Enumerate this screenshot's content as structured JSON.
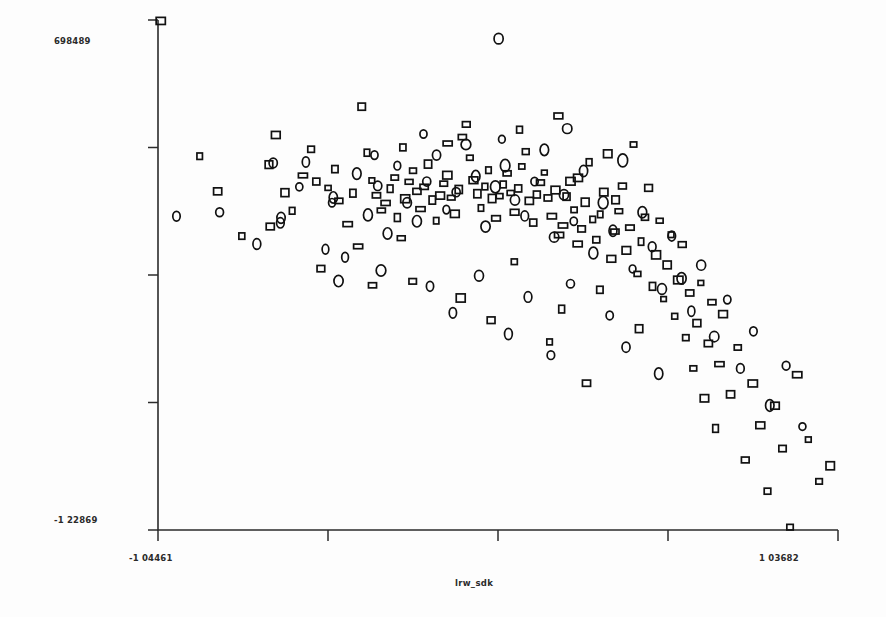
{
  "chart_data": {
    "type": "scatter",
    "title": "",
    "subtitle": "",
    "xlabel": "lrw_sdk",
    "ylabel": "",
    "xlim": [
      -1.04461,
      1.03682
    ],
    "ylim": [
      -1.22869,
      0.698489
    ],
    "x_tick_labels": [
      "-1 04461",
      "1 03682"
    ],
    "y_tick_labels": [
      "698489",
      "-1 22869"
    ],
    "x_tick_count": 5,
    "y_tick_count": 5,
    "grid": false,
    "legend": null,
    "legend_position": "none",
    "axis_style": "left-and-bottom-spines-only",
    "marker_colors": {
      "square": "#111111",
      "circle": "#111111"
    },
    "background": "#ffffff",
    "series": [
      {
        "name": "square",
        "marker": "open-square",
        "points": [
          [
            -1.0362,
            0.695
          ],
          [
            -0.917,
            0.1838
          ],
          [
            -0.705,
            0.152
          ],
          [
            -0.656,
            0.046
          ],
          [
            -0.634,
            -0.0225
          ],
          [
            -0.601,
            0.111
          ],
          [
            -0.701,
            -0.082
          ],
          [
            -0.576,
            0.21
          ],
          [
            -0.56,
            0.088
          ],
          [
            -0.524,
            0.064
          ],
          [
            -0.503,
            0.135
          ],
          [
            -0.491,
            0.015
          ],
          [
            -0.464,
            -0.073
          ],
          [
            -0.448,
            0.044
          ],
          [
            -0.432,
            -0.157
          ],
          [
            -0.421,
            0.371
          ],
          [
            -0.405,
            0.197
          ],
          [
            -0.39,
            0.092
          ],
          [
            -0.376,
            0.036
          ],
          [
            -0.361,
            -0.021
          ],
          [
            -0.348,
            0.007
          ],
          [
            -0.334,
            0.061
          ],
          [
            -0.32,
            0.103
          ],
          [
            -0.312,
            -0.048
          ],
          [
            -0.3,
            -0.126
          ],
          [
            -0.288,
            0.023
          ],
          [
            -0.276,
            0.087
          ],
          [
            -0.264,
            0.129
          ],
          [
            -0.252,
            0.051
          ],
          [
            -0.241,
            -0.016
          ],
          [
            -0.23,
            0.068
          ],
          [
            -0.218,
            0.154
          ],
          [
            -0.205,
            0.018
          ],
          [
            -0.193,
            -0.06
          ],
          [
            -0.181,
            0.035
          ],
          [
            -0.17,
            0.08
          ],
          [
            -0.159,
            0.112
          ],
          [
            -0.147,
            0.027
          ],
          [
            -0.136,
            -0.034
          ],
          [
            -0.124,
            0.058
          ],
          [
            -0.113,
            0.256
          ],
          [
            -0.101,
            0.304
          ],
          [
            -0.09,
            0.178
          ],
          [
            -0.079,
            0.093
          ],
          [
            -0.067,
            0.042
          ],
          [
            -0.056,
            -0.012
          ],
          [
            -0.044,
            0.069
          ],
          [
            -0.033,
            0.131
          ],
          [
            -0.022,
            0.024
          ],
          [
            -0.01,
            -0.051
          ],
          [
            0.001,
            0.033
          ],
          [
            0.012,
            0.077
          ],
          [
            0.024,
            0.119
          ],
          [
            0.035,
            0.045
          ],
          [
            0.047,
            -0.028
          ],
          [
            0.058,
            0.062
          ],
          [
            0.069,
            0.145
          ],
          [
            0.081,
            0.201
          ],
          [
            0.092,
            0.015
          ],
          [
            0.104,
            -0.067
          ],
          [
            0.115,
            0.039
          ],
          [
            0.126,
            0.084
          ],
          [
            0.138,
            0.122
          ],
          [
            0.149,
            0.026
          ],
          [
            0.161,
            -0.043
          ],
          [
            0.172,
            0.056
          ],
          [
            0.183,
            -0.114
          ],
          [
            0.195,
            -0.078
          ],
          [
            0.206,
            0.031
          ],
          [
            0.218,
            0.089
          ],
          [
            0.229,
            -0.019
          ],
          [
            0.24,
            -0.148
          ],
          [
            0.252,
            -0.091
          ],
          [
            0.263,
            0.01
          ],
          [
            0.275,
            0.161
          ],
          [
            0.286,
            -0.055
          ],
          [
            0.297,
            -0.132
          ],
          [
            0.309,
            -0.036
          ],
          [
            0.32,
            0.048
          ],
          [
            0.332,
            0.193
          ],
          [
            0.343,
            -0.204
          ],
          [
            0.354,
            -0.101
          ],
          [
            0.366,
            -0.024
          ],
          [
            0.377,
            0.071
          ],
          [
            0.389,
            -0.172
          ],
          [
            0.4,
            -0.086
          ],
          [
            0.411,
            0.228
          ],
          [
            0.423,
            -0.261
          ],
          [
            0.434,
            -0.139
          ],
          [
            0.446,
            -0.047
          ],
          [
            0.457,
            0.064
          ],
          [
            0.469,
            -0.308
          ],
          [
            0.48,
            -0.189
          ],
          [
            0.491,
            -0.06
          ],
          [
            0.503,
            -0.356
          ],
          [
            0.514,
            -0.227
          ],
          [
            0.526,
            -0.113
          ],
          [
            0.537,
            -0.421
          ],
          [
            0.548,
            -0.284
          ],
          [
            0.56,
            -0.15
          ],
          [
            0.571,
            -0.502
          ],
          [
            0.583,
            -0.333
          ],
          [
            0.594,
            -0.618
          ],
          [
            0.605,
            -0.447
          ],
          [
            0.617,
            -0.295
          ],
          [
            0.628,
            -0.731
          ],
          [
            0.64,
            -0.524
          ],
          [
            0.651,
            -0.368
          ],
          [
            0.662,
            -0.845
          ],
          [
            0.674,
            -0.602
          ],
          [
            0.685,
            -0.413
          ],
          [
            0.708,
            -0.716
          ],
          [
            0.73,
            -0.539
          ],
          [
            0.753,
            -0.964
          ],
          [
            0.776,
            -0.675
          ],
          [
            0.799,
            -0.833
          ],
          [
            0.821,
            -1.082
          ],
          [
            0.844,
            -0.759
          ],
          [
            0.867,
            -0.921
          ],
          [
            0.89,
            -1.218
          ],
          [
            0.912,
            -0.642
          ],
          [
            0.946,
            -0.887
          ],
          [
            0.979,
            -1.045
          ],
          [
            1.013,
            -0.986
          ],
          [
            -0.862,
            0.051
          ],
          [
            -0.788,
            -0.118
          ],
          [
            -0.684,
            0.264
          ],
          [
            -0.546,
            -0.241
          ],
          [
            -0.265,
            -0.289
          ],
          [
            -0.118,
            -0.352
          ],
          [
            0.046,
            -0.215
          ],
          [
            0.191,
            -0.394
          ],
          [
            0.308,
            -0.321
          ],
          [
            0.428,
            -0.468
          ],
          [
            -0.388,
            -0.304
          ],
          [
            -0.025,
            -0.436
          ],
          [
            0.154,
            -0.518
          ],
          [
            0.267,
            -0.674
          ],
          [
            -0.158,
            0.232
          ],
          [
            0.062,
            0.284
          ],
          [
            0.181,
            0.336
          ],
          [
            -0.295,
            0.217
          ],
          [
            0.241,
            0.102
          ],
          [
            0.356,
            0.019
          ]
        ]
      },
      {
        "name": "circle",
        "marker": "open-circle",
        "points": [
          [
            -0.002,
            0.628
          ],
          [
            -0.988,
            -0.043
          ],
          [
            -0.856,
            -0.028
          ],
          [
            -0.692,
            0.158
          ],
          [
            -0.668,
            -0.049
          ],
          [
            -0.67,
            -0.068
          ],
          [
            -0.592,
            0.162
          ],
          [
            -0.508,
            0.028
          ],
          [
            -0.512,
            0.008
          ],
          [
            -0.472,
            -0.198
          ],
          [
            -0.436,
            0.118
          ],
          [
            -0.402,
            -0.038
          ],
          [
            -0.372,
            0.072
          ],
          [
            -0.342,
            -0.108
          ],
          [
            -0.312,
            0.148
          ],
          [
            -0.282,
            0.008
          ],
          [
            -0.252,
            -0.062
          ],
          [
            -0.222,
            0.088
          ],
          [
            -0.192,
            0.188
          ],
          [
            -0.162,
            -0.018
          ],
          [
            -0.132,
            0.048
          ],
          [
            -0.102,
            0.228
          ],
          [
            -0.072,
            0.108
          ],
          [
            -0.042,
            -0.082
          ],
          [
            -0.012,
            0.068
          ],
          [
            0.018,
            0.148
          ],
          [
            0.048,
            0.018
          ],
          [
            0.078,
            -0.042
          ],
          [
            0.108,
            0.088
          ],
          [
            0.138,
            0.208
          ],
          [
            0.168,
            -0.122
          ],
          [
            0.198,
            0.038
          ],
          [
            0.228,
            -0.062
          ],
          [
            0.258,
            0.128
          ],
          [
            0.288,
            -0.182
          ],
          [
            0.318,
            0.008
          ],
          [
            0.348,
            -0.098
          ],
          [
            0.378,
            0.168
          ],
          [
            0.408,
            -0.242
          ],
          [
            0.438,
            -0.028
          ],
          [
            0.468,
            -0.158
          ],
          [
            0.498,
            -0.318
          ],
          [
            0.528,
            -0.118
          ],
          [
            0.558,
            -0.278
          ],
          [
            0.588,
            -0.402
          ],
          [
            0.618,
            -0.228
          ],
          [
            0.658,
            -0.498
          ],
          [
            0.698,
            -0.358
          ],
          [
            0.738,
            -0.618
          ],
          [
            0.778,
            -0.478
          ],
          [
            0.828,
            -0.758
          ],
          [
            0.878,
            -0.608
          ],
          [
            0.928,
            -0.838
          ],
          [
            -0.742,
            -0.148
          ],
          [
            -0.362,
            -0.248
          ],
          [
            -0.212,
            -0.308
          ],
          [
            -0.062,
            -0.268
          ],
          [
            0.088,
            -0.348
          ],
          [
            0.218,
            -0.298
          ],
          [
            0.338,
            -0.418
          ],
          [
            -0.492,
            -0.288
          ],
          [
            -0.142,
            -0.408
          ],
          [
            0.028,
            -0.488
          ],
          [
            0.158,
            -0.568
          ],
          [
            -0.232,
            0.268
          ],
          [
            0.008,
            0.248
          ],
          [
            0.208,
            0.288
          ],
          [
            -0.382,
            0.188
          ],
          [
            0.388,
            -0.538
          ],
          [
            0.488,
            -0.638
          ],
          [
            -0.612,
            0.068
          ],
          [
            -0.532,
            -0.168
          ]
        ]
      }
    ]
  },
  "layout": {
    "plot_left": 158,
    "plot_right": 838,
    "plot_top": 20,
    "plot_bottom": 530
  }
}
